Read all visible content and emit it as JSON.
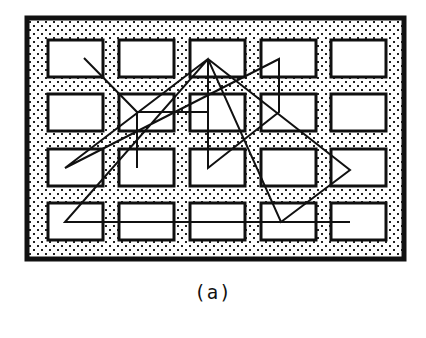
{
  "figure": {
    "caption": "(a)",
    "frame": {
      "x": 27,
      "y": 18,
      "width": 377,
      "height": 241,
      "stroke": "#111111",
      "stroke_width": 5,
      "fill_pattern": "dots",
      "dot_color": "#222222"
    },
    "grid": {
      "rows": 4,
      "cols": 5,
      "col_x": [
        48,
        119,
        190,
        261,
        331
      ],
      "row_y": [
        40,
        94,
        149,
        203
      ],
      "cell_width": 55,
      "cell_height": 37,
      "stroke": "#111111",
      "fill": "#ffffff"
    },
    "path": {
      "stroke": "#111111",
      "points": [
        [
          84,
          58
        ],
        [
          137,
          112
        ],
        [
          137,
          168
        ],
        [
          137,
          112
        ],
        [
          208,
          112
        ],
        [
          208,
          59
        ],
        [
          208,
          168
        ],
        [
          279,
          112
        ],
        [
          279,
          59
        ],
        [
          65,
          168
        ],
        [
          208,
          59
        ],
        [
          350,
          170
        ],
        [
          281,
          222
        ],
        [
          208,
          59
        ],
        [
          65,
          222
        ],
        [
          350,
          222
        ]
      ]
    }
  }
}
